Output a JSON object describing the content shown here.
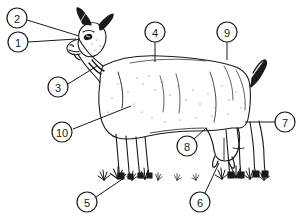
{
  "figure": {
    "style": "black-and-white line drawing",
    "background_color": "#ffffff",
    "ink_color": "#1a1a1a",
    "callout_circle_radius": 10,
    "callouts": [
      {
        "id": "callout-1",
        "label": "1",
        "cx": 18,
        "cy": 42,
        "leader": [
          [
            28,
            42
          ],
          [
            76,
            39
          ]
        ]
      },
      {
        "id": "callout-2",
        "label": "2",
        "cx": 17,
        "cy": 18,
        "leader": [
          [
            27,
            20
          ],
          [
            79,
            36
          ]
        ]
      },
      {
        "id": "callout-3",
        "label": "3",
        "cx": 58,
        "cy": 87,
        "leader": [
          [
            68,
            84
          ],
          [
            97,
            66
          ]
        ]
      },
      {
        "id": "callout-4",
        "label": "4",
        "cx": 155,
        "cy": 32,
        "leader": [
          [
            155,
            42
          ],
          [
            155,
            62
          ]
        ]
      },
      {
        "id": "callout-5",
        "label": "5",
        "cx": 87,
        "cy": 202,
        "leader": [
          [
            96,
            197
          ],
          [
            124,
            178
          ]
        ]
      },
      {
        "id": "callout-6",
        "label": "6",
        "cx": 200,
        "cy": 202,
        "leader": [
          [
            205,
            193
          ],
          [
            219,
            163
          ]
        ]
      },
      {
        "id": "callout-7",
        "label": "7",
        "cx": 285,
        "cy": 122,
        "leader": [
          [
            275,
            122
          ],
          [
            245,
            122
          ]
        ]
      },
      {
        "id": "callout-8",
        "label": "8",
        "cx": 187,
        "cy": 146,
        "leader": [
          [
            194,
            139
          ],
          [
            206,
            128
          ]
        ]
      },
      {
        "id": "callout-9",
        "label": "9",
        "cx": 227,
        "cy": 32,
        "leader": [
          [
            227,
            42
          ],
          [
            227,
            60
          ]
        ]
      },
      {
        "id": "callout-10",
        "label": "10",
        "cx": 62,
        "cy": 132,
        "leader": [
          [
            73,
            129
          ],
          [
            131,
            106
          ]
        ]
      }
    ],
    "grass_tufts": [
      {
        "x": 104,
        "y": 180,
        "scale": 1.0
      },
      {
        "x": 118,
        "y": 179,
        "scale": 1.1
      },
      {
        "x": 132,
        "y": 180,
        "scale": 0.9
      },
      {
        "x": 145,
        "y": 179,
        "scale": 1.0
      },
      {
        "x": 158,
        "y": 180,
        "scale": 0.8
      },
      {
        "x": 177,
        "y": 180,
        "scale": 0.7
      },
      {
        "x": 196,
        "y": 180,
        "scale": 0.7
      },
      {
        "x": 222,
        "y": 179,
        "scale": 1.0
      },
      {
        "x": 236,
        "y": 178,
        "scale": 1.1
      },
      {
        "x": 250,
        "y": 179,
        "scale": 1.0
      },
      {
        "x": 264,
        "y": 180,
        "scale": 0.9
      }
    ]
  }
}
